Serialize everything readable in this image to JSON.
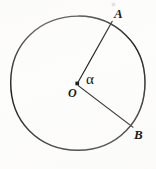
{
  "figure": {
    "kind": "geometry-diagram",
    "background_color": "#fdfdfc",
    "ink_color": "#1a1a1a",
    "labels": {
      "center": "O",
      "point_a": "A",
      "point_b": "B",
      "angle": "α"
    },
    "geometry": {
      "circle": {
        "center_x": 78,
        "center_y": 83,
        "radius": 67,
        "stroke_width": 1.5
      },
      "center_dot": {
        "x": 77,
        "y": 84,
        "size": 3.4,
        "shape": "square"
      },
      "radius_oa": {
        "x1": 77,
        "y1": 83,
        "x2": 112,
        "y2": 21,
        "stroke_width": 1.2
      },
      "radius_ob": {
        "x1": 78,
        "y1": 86,
        "x2": 133,
        "y2": 127,
        "stroke_width": 1.2
      }
    },
    "label_positions": {
      "a_x": 114,
      "a_y": 7,
      "b_x": 134,
      "b_y": 128,
      "o_x": 68,
      "o_y": 87,
      "alpha_x": 86,
      "alpha_y": 72
    }
  }
}
